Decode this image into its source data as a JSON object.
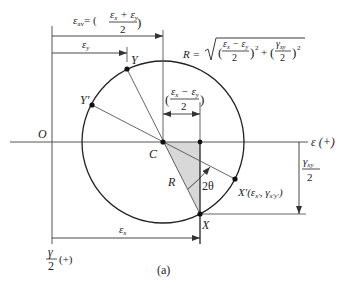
{
  "figure": {
    "caption": "(a)",
    "stroke_color": "#555555",
    "circle_color": "#222222",
    "shade_color": "#d8d8d8"
  },
  "axes": {
    "origin_label": "O",
    "horizontal_label": "ε (+)",
    "vertical_label_num": "γ",
    "vertical_label_den": "2",
    "vertical_label_sign": "(+)"
  },
  "points": {
    "center": "C",
    "x": "X",
    "y": "Y",
    "x_prime": "X′(ε",
    "x_prime_sub1": "x′",
    "x_prime_sep": ", γ",
    "x_prime_sub2": "x′y′",
    "x_prime_close": ")",
    "y_prime": "Y′"
  },
  "dimensions": {
    "eps_av": {
      "lhs": "ε",
      "lhs_sub": "av",
      "eq": "= (",
      "num": "ε",
      "num_sub1": "x",
      "num_op": " + ε",
      "num_sub2": "y",
      "den": "2",
      "close": ")"
    },
    "eps_y": {
      "label": "ε",
      "sub": "y"
    },
    "eps_x": {
      "label": "ε",
      "sub": "x"
    },
    "half_diff": {
      "open": "(",
      "num": "ε",
      "num_sub1": "x",
      "num_op": " − ε",
      "num_sub2": "y",
      "den": "2",
      "close": ")"
    },
    "gamma_half": {
      "num": "γ",
      "num_sub": "xy",
      "den": "2"
    },
    "radius_label": "R",
    "angle_label": "2θ"
  },
  "radius_formula": {
    "lhs": "R =",
    "term1_num": "ε",
    "term1_sub1": "x",
    "term1_op": " − ε",
    "term1_sub2": "y",
    "term1_den": "2",
    "term2_num": "γ",
    "term2_sub": "xy",
    "term2_den": "2",
    "power": "2",
    "plus": "+"
  }
}
